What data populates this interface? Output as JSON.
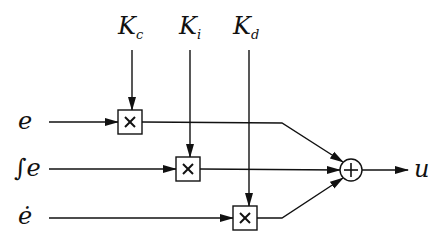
{
  "diagram": {
    "gains": [
      {
        "symbol": "K",
        "sub": "c"
      },
      {
        "symbol": "K",
        "sub": "i"
      },
      {
        "symbol": "K",
        "sub": "d"
      }
    ],
    "inputs": [
      {
        "label": "e"
      },
      {
        "label": "∫e"
      },
      {
        "label": "ė"
      }
    ],
    "multiplier_symbol": "×",
    "summer_symbol": "+",
    "output": {
      "label": "u"
    }
  }
}
